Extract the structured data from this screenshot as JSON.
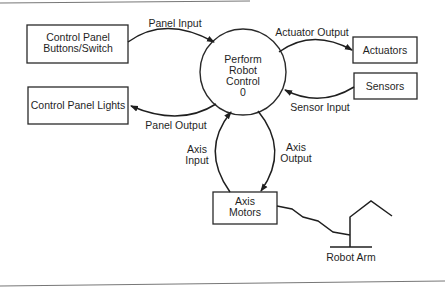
{
  "diagram": {
    "type": "data-flow-diagram",
    "process": {
      "lines": [
        "Perform",
        "Robot",
        "Control",
        "0"
      ]
    },
    "entities": {
      "control_panel_buttons": {
        "lines": [
          "Control Panel",
          "Buttons/Switch"
        ]
      },
      "control_panel_lights": {
        "lines": [
          "Control Panel Lights"
        ]
      },
      "actuators": {
        "lines": [
          "Actuators"
        ]
      },
      "sensors": {
        "lines": [
          "Sensors"
        ]
      },
      "axis_motors": {
        "lines": [
          "Axis",
          "Motors"
        ]
      }
    },
    "flows": {
      "panel_input": {
        "label": "Panel Input",
        "from": "Control Panel Buttons/Switch",
        "to": "Perform Robot Control"
      },
      "panel_output": {
        "label": "Panel Output",
        "from": "Perform Robot Control",
        "to": "Control Panel Lights"
      },
      "actuator_output": {
        "label": "Actuator Output",
        "from": "Perform Robot Control",
        "to": "Actuators"
      },
      "sensor_input": {
        "label": "Sensor Input",
        "from": "Sensors",
        "to": "Perform Robot Control"
      },
      "axis_input": {
        "lines": [
          "Axis",
          "Input"
        ],
        "from": "Axis Motors",
        "to": "Perform Robot Control"
      },
      "axis_output": {
        "lines": [
          "Axis",
          "Output"
        ],
        "from": "Perform Robot Control",
        "to": "Axis Motors"
      }
    },
    "illustration": {
      "robot_arm_label": "Robot Arm"
    },
    "colors": {
      "stroke": "#1f1f1f",
      "background": "#ffffff",
      "frame": "#777777"
    }
  }
}
